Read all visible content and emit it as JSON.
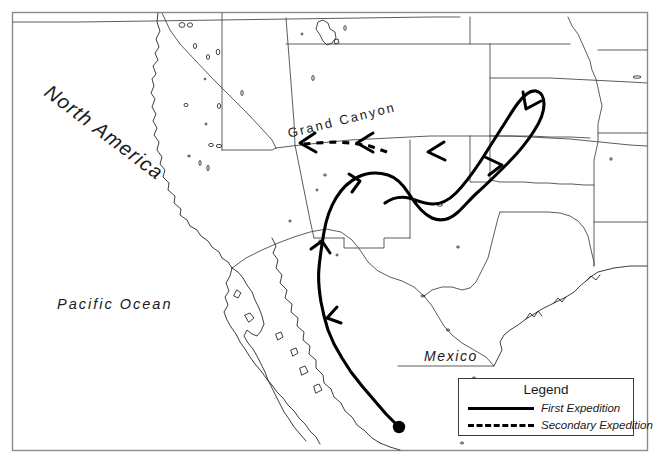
{
  "figure": {
    "type": "map",
    "region": "Southwestern United States and Northern Mexico",
    "background_color": "#ffffff",
    "frame_color": "#8a8a8a"
  },
  "labels": {
    "north_america": "North America",
    "pacific_ocean": "Pacific Ocean",
    "mexico": "Mexico",
    "grand_canyon": "Grand Canyon"
  },
  "legend": {
    "title": "Legend",
    "entries": [
      {
        "style": "solid",
        "label": "First Expedition",
        "color": "#000000"
      },
      {
        "style": "dashed",
        "label": "Secondary Expedition",
        "color": "#000000"
      }
    ]
  },
  "routes": {
    "primary": {
      "name": "First Expedition",
      "style": "solid",
      "color": "#000000",
      "origin_marker": "filled-circle",
      "origin_point": [
        399,
        427
      ],
      "direction_arrows": 5
    },
    "secondary": {
      "name": "Secondary Expedition",
      "style": "dashed",
      "color": "#000000",
      "direction_arrows": 2
    }
  }
}
